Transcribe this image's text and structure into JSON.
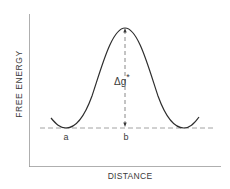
{
  "diagram": {
    "y_axis_label": "FREE ENERGY",
    "x_axis_label": "DISTANCE",
    "barrier_label_main": "Δg",
    "barrier_label_sup": "*",
    "point_a_label": "a",
    "point_b_label": "b",
    "colors": {
      "ink": "#2e2e2e",
      "axis": "#8a8a8a",
      "dash": "#8a8a8a",
      "background": "#ffffff"
    }
  }
}
